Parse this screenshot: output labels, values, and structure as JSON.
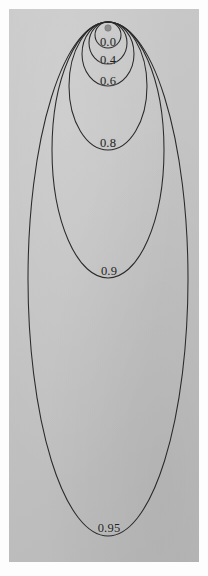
{
  "figure": {
    "title": "",
    "background_color": "#c4c4c4",
    "curve_color": "#2a2a2a",
    "focus_dot_color": "#8d8d8d",
    "focus_dot": {
      "cx": 108,
      "cy": 28,
      "r": 3.2,
      "name": "focus-point"
    },
    "tangent_point": {
      "x": 108,
      "y": 22
    }
  },
  "chart_data": {
    "type": "line",
    "title": "",
    "subtitle": "",
    "xlabel": "",
    "ylabel": "",
    "grid": false,
    "legend_position": "inline-labels",
    "parameter_name": "eccentricity",
    "categories": [
      "0.0",
      "0.4",
      "0.6",
      "0.8",
      "0.9",
      "0.95"
    ],
    "values": [
      0.0,
      0.4,
      0.6,
      0.8,
      0.9,
      0.95
    ],
    "series": [
      {
        "name": "0.0",
        "label": "0.0",
        "eccentricity": 0.0,
        "center_x": 108,
        "center_y": 35,
        "semi_major_y": 13,
        "semi_minor_x": 13,
        "label_x": 108,
        "label_y": 42
      },
      {
        "name": "0.4",
        "label": "0.4",
        "eccentricity": 0.4,
        "center_x": 108,
        "center_y": 43,
        "semi_major_y": 21,
        "semi_minor_x": 19,
        "label_x": 108,
        "label_y": 60
      },
      {
        "name": "0.6",
        "label": "0.6",
        "eccentricity": 0.6,
        "center_x": 108,
        "center_y": 54,
        "semi_major_y": 32,
        "semi_minor_x": 26,
        "label_x": 108,
        "label_y": 81
      },
      {
        "name": "0.8",
        "label": "0.8",
        "eccentricity": 0.8,
        "center_x": 108,
        "center_y": 86,
        "semi_major_y": 64,
        "semi_minor_x": 39,
        "label_x": 108,
        "label_y": 143
      },
      {
        "name": "0.9",
        "label": "0.9",
        "eccentricity": 0.9,
        "center_x": 108,
        "center_y": 150,
        "semi_major_y": 128,
        "semi_minor_x": 56,
        "label_x": 109,
        "label_y": 271
      },
      {
        "name": "0.95",
        "label": "0.95",
        "eccentricity": 0.95,
        "center_x": 108,
        "center_y": 279,
        "semi_major_y": 257,
        "semi_minor_x": 80,
        "label_x": 109,
        "label_y": 528
      }
    ],
    "xlim": [
      9,
      199
    ],
    "ylim": [
      9,
      562
    ]
  }
}
